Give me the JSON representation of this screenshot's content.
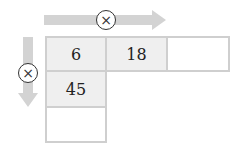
{
  "operator": {
    "symbol": "×"
  },
  "grid": {
    "row0": [
      "6",
      "18",
      ""
    ],
    "col0": [
      "6",
      "45",
      ""
    ]
  },
  "cells": {
    "r0c0": "6",
    "r0c1": "18",
    "r0c2": "",
    "r1c0": "45",
    "r2c0": ""
  },
  "colors": {
    "arrow": "#d3d3d3",
    "cell_fill": "#efefef",
    "border": "#cfcfcf"
  }
}
